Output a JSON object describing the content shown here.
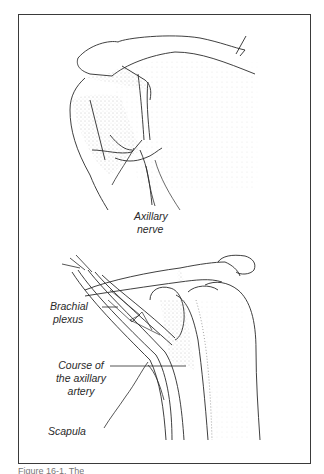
{
  "figure": {
    "panels": [
      {
        "id": "top",
        "description": "Shoulder joint, posterior view",
        "labels": [
          {
            "text_line1": "Axillary",
            "text_line2": "nerve"
          }
        ]
      },
      {
        "id": "bottom",
        "description": "Shoulder joint with brachial plexus, anterior view",
        "labels": [
          {
            "text_line1": "Brachial",
            "text_line2": "plexus"
          },
          {
            "text_line1": "Course of",
            "text_line2": "the axillary",
            "text_line3": "artery"
          },
          {
            "text_line1": "Scapula"
          }
        ]
      }
    ],
    "caption": "Figure 16-1. The"
  },
  "colors": {
    "line": "#2a2a2a",
    "stipple": "#9a9a9a",
    "frame": "#3a3a3a",
    "background": "#ffffff"
  }
}
